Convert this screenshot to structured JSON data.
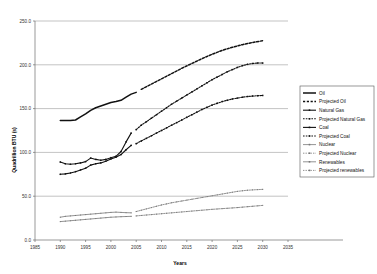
{
  "chart_data": {
    "type": "line",
    "title": "",
    "xlabel": "Years",
    "ylabel": "Quadrillion BTU (s)",
    "xlim": [
      1985,
      2035
    ],
    "ylim": [
      0,
      250
    ],
    "xticks": [
      "1985",
      "1990",
      "1995",
      "2000",
      "2005",
      "2010",
      "2015",
      "2020",
      "2025",
      "2030",
      "2035"
    ],
    "yticks": [
      "0.0",
      "50.0",
      "100.0",
      "150.0",
      "200.0",
      "250.0"
    ],
    "grid": true,
    "legend_position": "right",
    "series": [
      {
        "name": "Oil",
        "style": "solid-thick",
        "x": [
          1990,
          1991,
          1992,
          1993,
          1994,
          1995,
          1996,
          1997,
          1998,
          1999,
          2000,
          2001,
          2002,
          2003,
          2004,
          2005
        ],
        "values": [
          136.5,
          136.3,
          136.4,
          137.0,
          140.5,
          144.0,
          148.0,
          151.0,
          153.0,
          155.0,
          157.0,
          158.0,
          159.5,
          163.0,
          166.5,
          168.5
        ]
      },
      {
        "name": "Projected Oil",
        "style": "dashed",
        "x": [
          2006,
          2008,
          2010,
          2012,
          2014,
          2016,
          2018,
          2020,
          2022,
          2024,
          2026,
          2028,
          2030
        ],
        "values": [
          172.0,
          178.0,
          184.0,
          190.0,
          196.0,
          201.5,
          207.0,
          212.0,
          216.5,
          220.0,
          223.0,
          225.5,
          227.5
        ]
      },
      {
        "name": "Natural Gas",
        "style": "solid-marker",
        "x": [
          1990,
          1991,
          1992,
          1993,
          1994,
          1995,
          1996,
          1997,
          1998,
          1999,
          2000,
          2001,
          2002,
          2003,
          2004
        ],
        "values": [
          89.0,
          87.0,
          86.5,
          87.0,
          88.0,
          89.5,
          93.5,
          92.0,
          91.0,
          92.0,
          94.0,
          95.5,
          101.0,
          112.0,
          122.0
        ]
      },
      {
        "name": "Projected Natural Gas",
        "style": "dashed-marker",
        "x": [
          2005,
          2006,
          2007,
          2008,
          2009,
          2010,
          2011,
          2012,
          2013,
          2014,
          2015,
          2016,
          2017,
          2018,
          2019,
          2020,
          2021,
          2022,
          2023,
          2024,
          2025,
          2026,
          2027,
          2028,
          2029,
          2030
        ],
        "values": [
          126.0,
          131.0,
          135.0,
          139.0,
          143.0,
          147.0,
          151.0,
          155.0,
          158.5,
          162.0,
          165.5,
          169.0,
          172.5,
          176.0,
          179.5,
          183.0,
          186.0,
          189.0,
          192.0,
          194.5,
          197.0,
          199.0,
          200.5,
          201.5,
          202.0,
          202.0
        ]
      },
      {
        "name": "Coal",
        "style": "solid-marker",
        "x": [
          1990,
          1991,
          1992,
          1993,
          1994,
          1995,
          1996,
          1997,
          1998,
          1999,
          2000,
          2001,
          2002,
          2003,
          2004
        ],
        "values": [
          75.0,
          75.5,
          76.5,
          78.0,
          80.0,
          82.0,
          85.5,
          87.0,
          88.0,
          90.0,
          92.5,
          94.5,
          97.5,
          103.0,
          108.0
        ]
      },
      {
        "name": "Projected Coal",
        "style": "dashed-marker",
        "x": [
          2005,
          2006,
          2007,
          2008,
          2009,
          2010,
          2011,
          2012,
          2013,
          2014,
          2015,
          2016,
          2017,
          2018,
          2019,
          2020,
          2021,
          2022,
          2023,
          2024,
          2025,
          2026,
          2027,
          2028,
          2029,
          2030
        ],
        "values": [
          110.0,
          113.0,
          116.0,
          119.0,
          122.0,
          125.0,
          128.0,
          131.0,
          134.0,
          137.0,
          140.0,
          143.0,
          146.0,
          149.0,
          151.5,
          154.0,
          156.0,
          158.0,
          159.5,
          161.0,
          162.0,
          163.0,
          163.8,
          164.3,
          164.7,
          165.0
        ]
      },
      {
        "name": "Nuclear",
        "style": "solid-thin",
        "x": [
          1990,
          1991,
          1992,
          1993,
          1994,
          1995,
          1996,
          1997,
          1998,
          1999,
          2000,
          2001,
          2002,
          2003,
          2004
        ],
        "values": [
          26.0,
          27.0,
          27.5,
          28.0,
          28.5,
          29.0,
          29.5,
          30.0,
          30.5,
          31.0,
          31.5,
          31.8,
          31.5,
          31.2,
          31.0
        ]
      },
      {
        "name": "Projected Nuclear",
        "style": "dashed-thin",
        "x": [
          2005,
          2006,
          2007,
          2008,
          2009,
          2010,
          2011,
          2012,
          2013,
          2014,
          2015,
          2016,
          2017,
          2018,
          2019,
          2020,
          2021,
          2022,
          2023,
          2024,
          2025,
          2026,
          2027,
          2028,
          2029,
          2030
        ],
        "values": [
          32.5,
          34.0,
          35.5,
          37.0,
          38.5,
          40.0,
          41.2,
          42.5,
          43.5,
          44.5,
          45.5,
          46.5,
          47.5,
          48.5,
          49.5,
          50.5,
          51.5,
          52.5,
          53.5,
          54.5,
          55.5,
          56.2,
          56.8,
          57.2,
          57.5,
          57.8
        ]
      },
      {
        "name": "Renewables",
        "style": "solid-thin",
        "x": [
          1990,
          1991,
          1992,
          1993,
          1994,
          1995,
          1996,
          1997,
          1998,
          1999,
          2000,
          2001,
          2002,
          2003,
          2004
        ],
        "values": [
          21.0,
          21.5,
          22.0,
          22.5,
          23.0,
          23.5,
          24.0,
          24.5,
          25.0,
          25.5,
          26.0,
          26.3,
          26.6,
          26.8,
          27.0
        ]
      },
      {
        "name": "Projected renewables",
        "style": "dashed-thin",
        "x": [
          2005,
          2006,
          2007,
          2008,
          2009,
          2010,
          2011,
          2012,
          2013,
          2014,
          2015,
          2016,
          2017,
          2018,
          2019,
          2020,
          2021,
          2022,
          2023,
          2024,
          2025,
          2026,
          2027,
          2028,
          2029,
          2030
        ],
        "values": [
          27.5,
          28.0,
          28.5,
          29.0,
          29.5,
          30.0,
          30.5,
          31.0,
          31.5,
          32.0,
          32.5,
          33.0,
          33.5,
          34.0,
          34.5,
          35.0,
          35.4,
          35.8,
          36.2,
          36.6,
          37.0,
          37.5,
          38.0,
          38.5,
          39.0,
          39.5
        ]
      }
    ]
  },
  "legend": {
    "items": [
      {
        "label": "Oil",
        "style": "solid-thick"
      },
      {
        "label": "Projected Oil",
        "style": "dashed"
      },
      {
        "label": "Natural Gas",
        "style": "solid-marker"
      },
      {
        "label": "Projected Natural Gas",
        "style": "dashed-marker"
      },
      {
        "label": "Coal",
        "style": "solid-marker"
      },
      {
        "label": "Projected Coal",
        "style": "dashed-marker"
      },
      {
        "label": "Nuclear",
        "style": "solid-thin"
      },
      {
        "label": "Projected Nuclear",
        "style": "dashed-thin"
      },
      {
        "label": "Renewables",
        "style": "solid-thin"
      },
      {
        "label": "Projected renewables",
        "style": "dashed-thin"
      }
    ]
  },
  "colors": {
    "ink": "#111111",
    "grid": "#9a9a9a",
    "axis": "#6f6f6f",
    "thin_series": "#777777",
    "background": "#ffffff"
  }
}
